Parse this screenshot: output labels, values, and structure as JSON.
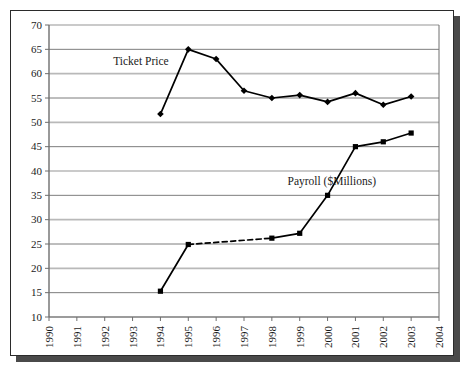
{
  "chart_data": {
    "type": "line",
    "title": "",
    "subtitle": "",
    "xlabel": "",
    "ylabel": "",
    "x": [
      1990,
      1991,
      1992,
      1993,
      1994,
      1995,
      1996,
      1997,
      1998,
      1999,
      2000,
      2001,
      2002,
      2003,
      2004
    ],
    "categories": [
      "1990",
      "1991",
      "1992",
      "1993",
      "1994",
      "1995",
      "1996",
      "1997",
      "1998",
      "1999",
      "2000",
      "2001",
      "2002",
      "2003",
      "2004"
    ],
    "xlim": [
      1990,
      2004
    ],
    "ylim": [
      10,
      70
    ],
    "ytick_values": [
      10,
      15,
      20,
      25,
      30,
      35,
      40,
      45,
      50,
      55,
      60,
      65,
      70
    ],
    "ytick_labels": [
      "10",
      "15",
      "20",
      "25",
      "30",
      "35",
      "40",
      "45",
      "50",
      "55",
      "60",
      "65",
      "70"
    ],
    "grid": true,
    "grid_axis": "y",
    "legend_position": "inline-annotations",
    "marker": "filled",
    "series": [
      {
        "name": "Ticket Price",
        "marker": "diamond",
        "color": "#000000",
        "line_style": "solid",
        "points": [
          {
            "x": 1994,
            "y": 51.7
          },
          {
            "x": 1995,
            "y": 65.0
          },
          {
            "x": 1996,
            "y": 63.0
          },
          {
            "x": 1997,
            "y": 56.5
          },
          {
            "x": 1998,
            "y": 55.0
          },
          {
            "x": 1999,
            "y": 55.6
          },
          {
            "x": 2000,
            "y": 54.2
          },
          {
            "x": 2001,
            "y": 56.0
          },
          {
            "x": 2002,
            "y": 53.6
          },
          {
            "x": 2003,
            "y": 55.3
          }
        ]
      },
      {
        "name": "Payroll ($Millions)",
        "marker": "square",
        "color": "#000000",
        "line_style": "solid-with-dashed-gap",
        "dashed_segment": {
          "from_x": 1995,
          "to_x": 1998
        },
        "points": [
          {
            "x": 1994,
            "y": 15.3
          },
          {
            "x": 1995,
            "y": 24.9
          },
          {
            "x": 1998,
            "y": 26.2
          },
          {
            "x": 1999,
            "y": 27.2
          },
          {
            "x": 2000,
            "y": 35.0
          },
          {
            "x": 2001,
            "y": 45.0
          },
          {
            "x": 2002,
            "y": 46.0
          },
          {
            "x": 2003,
            "y": 47.8
          }
        ]
      }
    ],
    "annotations": [
      {
        "name": "ticket-price-label",
        "text": "Ticket Price",
        "x": 1993.3,
        "y": 61.8
      },
      {
        "name": "payroll-label",
        "text": "Payroll ($Millions)",
        "x": 2000.15,
        "y": 37.2
      }
    ],
    "colors": {
      "line": "#000000",
      "grid_light": "#b9b9b9",
      "grid_dark": "#6e6e6e",
      "axis": "#6e6e6e",
      "frame": "#2b2b2b",
      "shadow": "#4a4a4a",
      "background": "#ffffff",
      "text": "#1a1a1a"
    }
  }
}
